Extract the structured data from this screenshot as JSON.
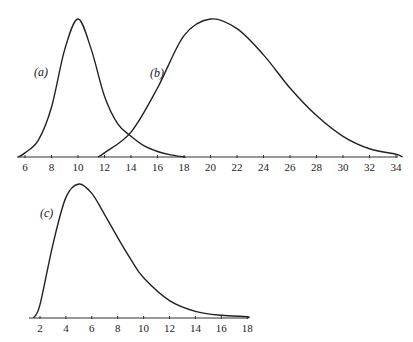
{
  "chart_data": [
    {
      "type": "line",
      "title": "",
      "xlabel": "",
      "ylabel": "",
      "xlim": [
        5.5,
        34.5
      ],
      "xticks": [
        6,
        8,
        10,
        12,
        14,
        16,
        18,
        20,
        22,
        24,
        26,
        28,
        30,
        32,
        34
      ],
      "grid": false,
      "series": [
        {
          "name": "(a)",
          "label": "(a)",
          "shape": "symmetric",
          "mode": 10,
          "range": [
            5.5,
            18
          ],
          "x": [
            6,
            7,
            8,
            9,
            10,
            11,
            12,
            13,
            14,
            15,
            16,
            17,
            18
          ],
          "y": [
            0.03,
            0.12,
            0.36,
            0.78,
            1.0,
            0.78,
            0.44,
            0.24,
            0.15,
            0.08,
            0.04,
            0.015,
            0.0
          ]
        },
        {
          "name": "(b)",
          "label": "(b)",
          "shape": "right-skewed",
          "mode": 20,
          "range": [
            11.5,
            34.5
          ],
          "x": [
            12,
            14,
            16,
            18,
            20,
            22,
            24,
            26,
            28,
            30,
            32,
            34
          ],
          "y": [
            0.03,
            0.18,
            0.5,
            0.88,
            1.0,
            0.93,
            0.74,
            0.5,
            0.3,
            0.15,
            0.06,
            0.02
          ]
        }
      ]
    },
    {
      "type": "line",
      "title": "",
      "xlabel": "",
      "ylabel": "",
      "xlim": [
        1.5,
        18
      ],
      "xticks": [
        2,
        4,
        6,
        8,
        10,
        12,
        14,
        16,
        18
      ],
      "grid": false,
      "series": [
        {
          "name": "(c)",
          "label": "(c)",
          "shape": "right-skewed",
          "mode": 5,
          "range": [
            1.5,
            18
          ],
          "x": [
            2,
            3,
            4,
            5,
            6,
            7,
            8,
            9,
            10,
            12,
            14,
            16,
            18
          ],
          "y": [
            0.1,
            0.55,
            0.9,
            1.0,
            0.93,
            0.77,
            0.6,
            0.44,
            0.3,
            0.13,
            0.05,
            0.02,
            0.01
          ]
        }
      ]
    }
  ]
}
